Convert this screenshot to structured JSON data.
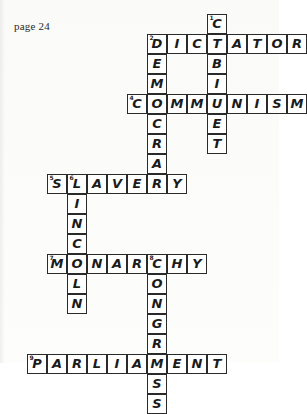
{
  "page": {
    "label": "page 24",
    "type": "crossword-puzzle-worksheet",
    "ink_color": "#1b1b1b",
    "grid_line_color": "#2a2a2a",
    "cell_background": "#ffffff",
    "cell_size_px": 20
  },
  "crossword": {
    "grid_origin": {
      "x": 7,
      "y": 14
    },
    "cell_size": 20,
    "columns": 15,
    "rows": 20,
    "entries": [
      {
        "number": "1",
        "direction": "down",
        "answer": "CABINET",
        "letters": [
          "C",
          "A",
          "B",
          "I",
          "N",
          "E",
          "T"
        ],
        "start": {
          "col": 10,
          "row": 0
        },
        "length": 7
      },
      {
        "number": "2",
        "direction": "across",
        "answer": "DICTATOR",
        "letters": [
          "D",
          "I",
          "C",
          "T",
          "A",
          "T",
          "O",
          "R"
        ],
        "start": {
          "col": 7,
          "row": 1
        },
        "length": 8
      },
      {
        "number": "3",
        "direction": "down",
        "answer": "DEMOCRACY",
        "letters": [
          "D",
          "E",
          "M",
          "O",
          "C",
          "R",
          "A",
          "C",
          "Y"
        ],
        "start": {
          "col": 7,
          "row": 1
        },
        "length": 9
      },
      {
        "number": "4",
        "direction": "across",
        "answer": "COMMUNISM",
        "letters": [
          "C",
          "O",
          "M",
          "M",
          "U",
          "N",
          "I",
          "S",
          "M"
        ],
        "start": {
          "col": 6,
          "row": 4
        },
        "length": 9
      },
      {
        "number": "5",
        "direction": "across",
        "answer": "SLAVERY",
        "letters": [
          "S",
          "L",
          "A",
          "V",
          "E",
          "R",
          "Y"
        ],
        "start": {
          "col": 2,
          "row": 8
        },
        "length": 7
      },
      {
        "number": "6",
        "direction": "down",
        "answer": "LINCOLN",
        "letters": [
          "L",
          "I",
          "N",
          "C",
          "O",
          "L",
          "N"
        ],
        "start": {
          "col": 3,
          "row": 8
        },
        "length": 7
      },
      {
        "number": "7",
        "direction": "across",
        "answer": "MONARCHY",
        "letters": [
          "M",
          "O",
          "N",
          "A",
          "R",
          "C",
          "H",
          "Y"
        ],
        "start": {
          "col": 2,
          "row": 12
        },
        "length": 8
      },
      {
        "number": "8",
        "direction": "down",
        "answer": "CONGRESS",
        "letters": [
          "C",
          "O",
          "N",
          "G",
          "R",
          "E",
          "S",
          "S"
        ],
        "start": {
          "col": 6,
          "row": 12
        },
        "length": 8
      },
      {
        "number": "9",
        "direction": "across",
        "answer": "PARLIAMENT",
        "letters": [
          "P",
          "A",
          "R",
          "L",
          "I",
          "A",
          "M",
          "E",
          "N",
          "T"
        ],
        "start": {
          "col": 1,
          "row": 16
        },
        "length": 10
      }
    ],
    "cells": [
      {
        "col": 10,
        "row": 0,
        "letter": "C",
        "num": "1"
      },
      {
        "col": 7,
        "row": 1,
        "letter": "D",
        "num": "2"
      },
      {
        "col": 8,
        "row": 1,
        "letter": "I",
        "num": ""
      },
      {
        "col": 9,
        "row": 1,
        "letter": "C",
        "num": ""
      },
      {
        "col": 10,
        "row": 1,
        "letter": "T",
        "num": ""
      },
      {
        "col": 11,
        "row": 1,
        "letter": "A",
        "num": ""
      },
      {
        "col": 12,
        "row": 1,
        "letter": "T",
        "num": ""
      },
      {
        "col": 13,
        "row": 1,
        "letter": "O",
        "num": ""
      },
      {
        "col": 14,
        "row": 1,
        "letter": "R",
        "num": ""
      },
      {
        "col": 7,
        "row": 2,
        "letter": "E",
        "num": ""
      },
      {
        "col": 10,
        "row": 2,
        "letter": "B",
        "num": ""
      },
      {
        "col": 7,
        "row": 3,
        "letter": "M",
        "num": ""
      },
      {
        "col": 10,
        "row": 3,
        "letter": "I",
        "num": ""
      },
      {
        "col": 6,
        "row": 4,
        "letter": "C",
        "num": "4"
      },
      {
        "col": 7,
        "row": 4,
        "letter": "O",
        "num": ""
      },
      {
        "col": 8,
        "row": 4,
        "letter": "M",
        "num": ""
      },
      {
        "col": 9,
        "row": 4,
        "letter": "M",
        "num": ""
      },
      {
        "col": 10,
        "row": 4,
        "letter": "U",
        "num": ""
      },
      {
        "col": 11,
        "row": 4,
        "letter": "N",
        "num": ""
      },
      {
        "col": 12,
        "row": 4,
        "letter": "I",
        "num": ""
      },
      {
        "col": 13,
        "row": 4,
        "letter": "S",
        "num": ""
      },
      {
        "col": 14,
        "row": 4,
        "letter": "M",
        "num": ""
      },
      {
        "col": 7,
        "row": 5,
        "letter": "C",
        "num": ""
      },
      {
        "col": 10,
        "row": 5,
        "letter": "E",
        "num": ""
      },
      {
        "col": 7,
        "row": 6,
        "letter": "R",
        "num": ""
      },
      {
        "col": 10,
        "row": 6,
        "letter": "T",
        "num": ""
      },
      {
        "col": 7,
        "row": 7,
        "letter": "A",
        "num": ""
      },
      {
        "col": 2,
        "row": 8,
        "letter": "S",
        "num": "5"
      },
      {
        "col": 3,
        "row": 8,
        "letter": "L",
        "num": "6"
      },
      {
        "col": 4,
        "row": 8,
        "letter": "A",
        "num": ""
      },
      {
        "col": 5,
        "row": 8,
        "letter": "V",
        "num": ""
      },
      {
        "col": 6,
        "row": 8,
        "letter": "E",
        "num": ""
      },
      {
        "col": 7,
        "row": 8,
        "letter": "R",
        "num": ""
      },
      {
        "col": 8,
        "row": 8,
        "letter": "Y",
        "num": ""
      },
      {
        "col": 3,
        "row": 9,
        "letter": "I",
        "num": ""
      },
      {
        "col": 3,
        "row": 10,
        "letter": "N",
        "num": ""
      },
      {
        "col": 3,
        "row": 11,
        "letter": "C",
        "num": ""
      },
      {
        "col": 2,
        "row": 12,
        "letter": "M",
        "num": "7"
      },
      {
        "col": 3,
        "row": 12,
        "letter": "O",
        "num": ""
      },
      {
        "col": 4,
        "row": 12,
        "letter": "N",
        "num": ""
      },
      {
        "col": 5,
        "row": 12,
        "letter": "A",
        "num": ""
      },
      {
        "col": 6,
        "row": 12,
        "letter": "R",
        "num": ""
      },
      {
        "col": 7,
        "row": 12,
        "letter": "C",
        "num": "8"
      },
      {
        "col": 8,
        "row": 12,
        "letter": "H",
        "num": ""
      },
      {
        "col": 9,
        "row": 12,
        "letter": "Y",
        "num": ""
      },
      {
        "col": 3,
        "row": 13,
        "letter": "L",
        "num": ""
      },
      {
        "col": 7,
        "row": 13,
        "letter": "O",
        "num": ""
      },
      {
        "col": 3,
        "row": 14,
        "letter": "N",
        "num": ""
      },
      {
        "col": 7,
        "row": 14,
        "letter": "N",
        "num": ""
      },
      {
        "col": 7,
        "row": 15,
        "letter": "G",
        "num": ""
      },
      {
        "col": 7,
        "row": 16,
        "letter": "R",
        "num": ""
      },
      {
        "col": 1,
        "row": 17,
        "letter": "P",
        "num": "9"
      },
      {
        "col": 2,
        "row": 17,
        "letter": "A",
        "num": ""
      },
      {
        "col": 3,
        "row": 17,
        "letter": "R",
        "num": ""
      },
      {
        "col": 4,
        "row": 17,
        "letter": "L",
        "num": ""
      },
      {
        "col": 5,
        "row": 17,
        "letter": "I",
        "num": ""
      },
      {
        "col": 6,
        "row": 17,
        "letter": "A",
        "num": ""
      },
      {
        "col": 7,
        "row": 17,
        "letter": "M",
        "num": ""
      },
      {
        "col": 8,
        "row": 17,
        "letter": "E",
        "num": ""
      },
      {
        "col": 9,
        "row": 17,
        "letter": "N",
        "num": ""
      },
      {
        "col": 10,
        "row": 17,
        "letter": "T",
        "num": ""
      },
      {
        "col": 7,
        "row": 18,
        "letter": "S",
        "num": ""
      },
      {
        "col": 7,
        "row": 19,
        "letter": "S",
        "num": ""
      }
    ]
  }
}
